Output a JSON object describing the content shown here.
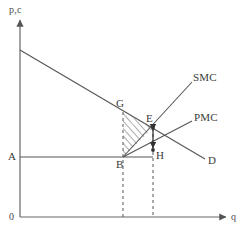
{
  "figure": {
    "type": "economics-externality-diagram",
    "background_color": "#ffffff",
    "line_color": "#555555",
    "text_color": "#3a3a3a"
  },
  "axes": {
    "y_label": "p,c",
    "x_label": "q",
    "origin_label": "0",
    "x_axis": {
      "x1": 20,
      "y1": 217,
      "x2": 228,
      "y2": 217
    },
    "y_axis": {
      "x1": 20,
      "y1": 217,
      "x2": 20,
      "y2": 18
    }
  },
  "curves": [
    {
      "name": "demand",
      "label": "D",
      "style": "solid",
      "from": {
        "x": 20,
        "y": 50
      },
      "to": {
        "x": 205,
        "y": 159
      },
      "label_pos": {
        "x": 208,
        "y": 156
      }
    },
    {
      "name": "social-marginal-cost",
      "label": "SMC",
      "style": "solid",
      "from": {
        "x": 123,
        "y": 157
      },
      "to": {
        "x": 192,
        "y": 82
      },
      "label_pos": {
        "x": 193,
        "y": 72
      }
    },
    {
      "name": "private-marginal-cost",
      "label": "PMC",
      "style": "solid",
      "from": {
        "x": 123,
        "y": 157
      },
      "to": {
        "x": 192,
        "y": 121
      },
      "label_pos": {
        "x": 194,
        "y": 112
      }
    },
    {
      "name": "price-line-A",
      "label": "A",
      "style": "solid",
      "from": {
        "x": 20,
        "y": 157
      },
      "to": {
        "x": 153,
        "y": 157
      },
      "label_pos": {
        "x": 8,
        "y": 153
      }
    }
  ],
  "points": [
    {
      "name": "G",
      "label": "G",
      "x": 123,
      "y": 112,
      "label_pos": {
        "x": 116,
        "y": 99
      },
      "dot": false
    },
    {
      "name": "E",
      "label": "E",
      "x": 153,
      "y": 128,
      "label_pos": {
        "x": 146,
        "y": 114
      },
      "dot": true
    },
    {
      "name": "B",
      "label": "B",
      "x": 123,
      "y": 157,
      "label_pos": {
        "x": 116,
        "y": 160
      },
      "dot": false
    },
    {
      "name": "H",
      "label": "H",
      "x": 153,
      "y": 150,
      "label_pos": {
        "x": 156,
        "y": 151
      },
      "dot": true
    }
  ],
  "dashed_lines": [
    {
      "name": "q-B-dropline",
      "x1": 123,
      "y1": 112,
      "x2": 123,
      "y2": 217
    },
    {
      "name": "q-E-dropline",
      "x1": 153,
      "y1": 128,
      "x2": 153,
      "y2": 217
    }
  ],
  "shaded_region": {
    "name": "deadweight-loss-triangle",
    "vertices": [
      {
        "label": "G",
        "x": 123,
        "y": 112
      },
      {
        "label": "E",
        "x": 153,
        "y": 128
      },
      {
        "label": "B",
        "x": 123,
        "y": 157
      }
    ],
    "fill": "hatch-diagonal"
  },
  "arrow_segment": {
    "name": "EH-arrow",
    "from": {
      "x": 153,
      "y": 128
    },
    "to": {
      "x": 153,
      "y": 150
    }
  }
}
